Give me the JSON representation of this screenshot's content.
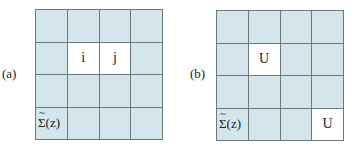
{
  "panels": [
    {
      "label": "(a)",
      "rows": 4,
      "cols": 4,
      "cells": [
        [
          "",
          "",
          "",
          ""
        ],
        [
          "",
          "i",
          "j",
          ""
        ],
        [
          "",
          "",
          "",
          ""
        ],
        [
          "Σ̃(z)",
          "",
          "",
          ""
        ]
      ],
      "white_cells": [
        [
          1,
          1
        ],
        [
          1,
          2
        ]
      ],
      "sigma_label": "Σ(z)",
      "sigma_tilde": "~",
      "cell_i": "i",
      "cell_j": "j"
    },
    {
      "label": "(b)",
      "rows": 4,
      "cols": 4,
      "cells": [
        [
          "",
          "",
          "",
          ""
        ],
        [
          "",
          "U",
          "",
          ""
        ],
        [
          "",
          "",
          "",
          ""
        ],
        [
          "Σ̃(z)",
          "",
          "",
          "U"
        ]
      ],
      "white_cells": [
        [
          1,
          1
        ],
        [
          3,
          3
        ]
      ],
      "sigma_label": "Σ(z)",
      "sigma_tilde": "~",
      "cell_u1": "U",
      "cell_u2": "U"
    }
  ],
  "colors": {
    "cell_fill": "#d4e6ec",
    "highlight_fill": "#ffffff",
    "grid_line": "#6c7a7e"
  }
}
